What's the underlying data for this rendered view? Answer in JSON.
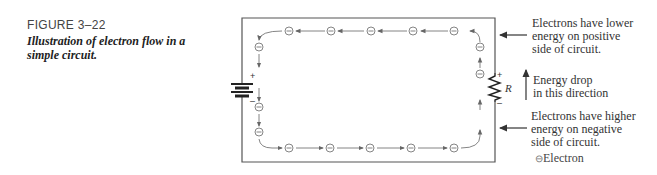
{
  "figure": {
    "number": "FIGURE 3–22",
    "title": "Illustration of electron flow in a simple circuit."
  },
  "circuit": {
    "battery_plus": "+",
    "battery_minus": "–",
    "resistor_label": "R",
    "resistor_plus": "+",
    "resistor_minus": "–",
    "electron_symbol": "⊖",
    "electron_count": 14
  },
  "annotations": {
    "lower_energy": [
      "Electrons have lower",
      "energy on positive",
      "side of circuit."
    ],
    "energy_drop": [
      "Energy drop",
      "in this direction"
    ],
    "higher_energy": [
      "Electrons have higher",
      "energy on negative",
      "side of circuit."
    ]
  },
  "legend": {
    "symbol": "⊖",
    "label": "Electron"
  },
  "colors": {
    "wire": "#555555",
    "flow": "#777777",
    "text": "#333333"
  }
}
